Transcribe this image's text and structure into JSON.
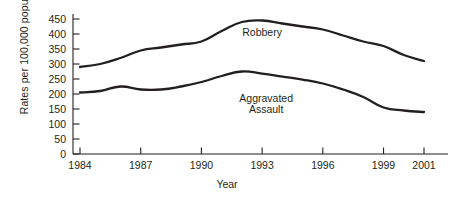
{
  "chart_data": {
    "type": "line",
    "title": "",
    "xlabel": "Year",
    "ylabel": "Rates per 100,000 population",
    "xlim": [
      1984,
      2001
    ],
    "ylim": [
      0,
      450
    ],
    "grid": false,
    "legend": "inline-series-labels",
    "ytick_labels": [
      "0",
      "50",
      "100",
      "150",
      "200",
      "250",
      "300",
      "350",
      "400",
      "450"
    ],
    "ytick_values": [
      0,
      50,
      100,
      150,
      200,
      250,
      300,
      350,
      400,
      450
    ],
    "xtick_labels": [
      "1984",
      "1987",
      "1990",
      "1993",
      "1996",
      "1999",
      "2001"
    ],
    "xtick_values": [
      1984,
      1987,
      1990,
      1993,
      1996,
      1999,
      2001
    ],
    "x": [
      1984,
      1985,
      1986,
      1987,
      1988,
      1989,
      1990,
      1991,
      1992,
      1993,
      1994,
      1995,
      1996,
      1997,
      1998,
      1999,
      2000,
      2001
    ],
    "series": [
      {
        "name": "Robbery",
        "color": "#231f20",
        "values": [
          290,
          300,
          320,
          345,
          355,
          365,
          375,
          410,
          440,
          445,
          435,
          425,
          415,
          395,
          375,
          360,
          330,
          310
        ]
      },
      {
        "name": "Aggravated Assault",
        "color": "#231f20",
        "values": [
          205,
          210,
          225,
          215,
          215,
          225,
          240,
          260,
          275,
          268,
          258,
          248,
          235,
          215,
          190,
          155,
          145,
          140
        ]
      }
    ],
    "annotations": [
      {
        "text": "Robbery",
        "x": 1993,
        "y": 405
      },
      {
        "text": "Aggravated\nAssault",
        "x": 1993.2,
        "y": 185
      }
    ]
  },
  "geometry": {
    "x_axis_px": {
      "start": 80,
      "end": 424
    },
    "y_axis_px": {
      "zero": 154,
      "top": 19
    },
    "axis_line_x": 73
  }
}
